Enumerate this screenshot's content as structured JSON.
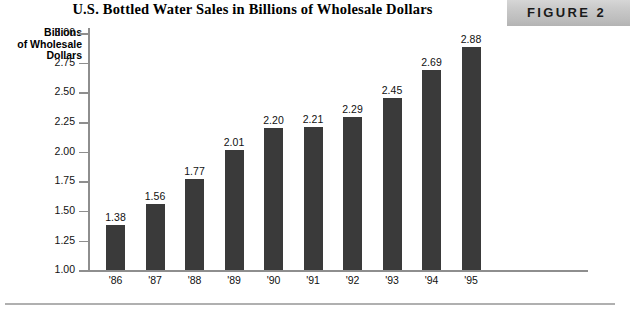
{
  "header": {
    "title": "U.S. Bottled Water Sales in Billions of Wholesale Dollars",
    "figure_label": "FIGURE 2",
    "banner_color": "#c4c4c4"
  },
  "axis_title": {
    "line1": "Billions",
    "line2": "of Wholesale",
    "line3": "Dollars"
  },
  "chart_data": {
    "type": "bar",
    "title": "U.S. Bottled Water Sales in Billions of Wholesale Dollars",
    "xlabel": "",
    "ylabel": "Billions of Wholesale Dollars",
    "categories": [
      "'86",
      "'87",
      "'88",
      "'89",
      "'90",
      "'91",
      "'92",
      "'93",
      "'94",
      "'95"
    ],
    "values": [
      1.38,
      1.56,
      1.77,
      2.01,
      2.2,
      2.21,
      2.29,
      2.45,
      2.69,
      2.88
    ],
    "value_labels": [
      "1.38",
      "1.56",
      "1.77",
      "2.01",
      "2.20",
      "2.21",
      "2.29",
      "2.45",
      "2.69",
      "2.88"
    ],
    "ylim": [
      1.0,
      3.05
    ],
    "ytick_values": [
      3.0,
      2.75,
      2.5,
      2.25,
      2.0,
      1.75,
      1.5,
      1.25,
      1.0
    ],
    "ytick_labels": [
      "3.00",
      "2.75",
      "2.50",
      "2.25",
      "2.00",
      "1.75",
      "1.50",
      "1.25",
      "1.00"
    ],
    "grid": false,
    "legend": null,
    "bar_color": "#3a3a3a",
    "axis_color": "#8e8e8e"
  }
}
